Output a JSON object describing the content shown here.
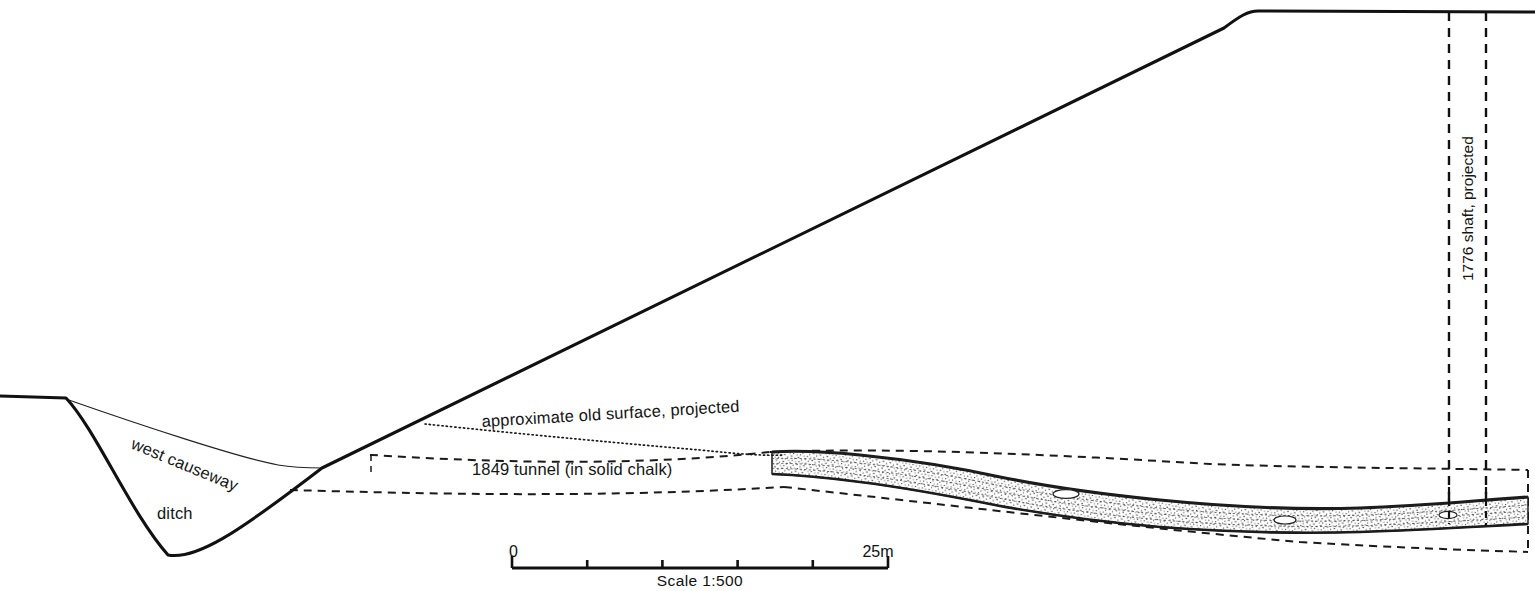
{
  "figure": {
    "type": "archaeological-section-drawing",
    "background_color": "#ffffff",
    "ink_color": "#111111",
    "width": 1535,
    "height": 591
  },
  "labels": {
    "west_causeway": "west causeway",
    "ditch": "ditch",
    "old_surface": "approximate old surface, projected",
    "tunnel_1849": "1849 tunnel (in solid chalk)",
    "shaft_1776": "1776 shaft, projected"
  },
  "scale": {
    "start_label": "0",
    "end_label": "25m",
    "caption": "Scale 1:500",
    "divisions": 5,
    "x_start": 512,
    "x_end": 888,
    "y": 568
  },
  "geometry": {
    "ground_profile": "M 0,396 L 66,398 C 96,430 130,512 168,555 C 196,560 236,534 322,468 L 1224,28 C 1240,16 1248,11 1258,11 L 1535,12",
    "causeway_line": "M 66,399 C 140,425 240,458 278,465 C 296,468 310,468 322,468",
    "old_surface_line": "M 425,424 C 520,434 640,445 700,450 C 740,454 762,456 784,455",
    "tunnel_upper_dash": "M 370,455 L 372,455 C 470,461 620,468 770,452",
    "tunnel_lower_dash": "M 290,490 C 430,494 600,498 784,487",
    "tunnel_upper_tick": "M 371,455 L 371,474",
    "tunnel_env_upper": "M 770,452 C 900,447 1060,455 1210,464 C 1320,468 1420,468 1528,470",
    "tunnel_env_lower": "M 784,487 C 950,505 1130,527 1300,542 C 1400,548 1470,550 1528,552",
    "tunnel_env_right": "M 1528,470 L 1528,552",
    "shaft_left_x": 1449,
    "shaft_right_x": 1486,
    "shaft_top_y": 12,
    "shaft_bottom_y": 525
  },
  "tunnel_body": {
    "top_edge": "M 772,452 C 800,450 830,452 860,455 C 900,459 950,466 1000,477 C 1050,487 1100,494 1160,500 C 1230,507 1300,510 1360,508 C 1420,506 1470,501 1528,497",
    "bottom_edge": "M 1528,524 C 1470,527 1420,530 1360,532 C 1300,534 1230,532 1160,527 C 1100,522 1050,515 1000,506 C 950,496 900,487 860,482 C 830,478 800,475 772,474"
  }
}
